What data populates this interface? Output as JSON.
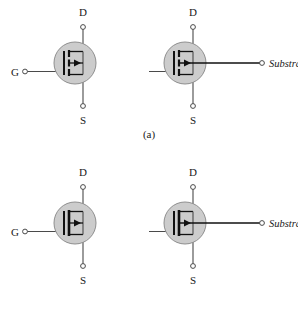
{
  "figure": {
    "background_color": "#ffffff",
    "line_color": "#4a4a4a",
    "device_line_color": "#111111",
    "envelope_fill": "#cccccc",
    "envelope_stroke": "#8f8f8f",
    "terminal_fill": "#ffffff"
  },
  "rows": [
    {
      "caption": "(a)",
      "symbols": [
        {
          "name": "n-channel-enhancement-mosfet-3terminal",
          "drain_label": "D",
          "source_label": "S",
          "gate_label": "G",
          "substrate_label": "",
          "has_substrate_terminal": false,
          "channel_style": "segmented",
          "arrow_direction": "right"
        },
        {
          "name": "n-channel-enhancement-mosfet-4terminal",
          "drain_label": "D",
          "source_label": "S",
          "gate_label": "G",
          "substrate_label": "Substrate",
          "has_substrate_terminal": true,
          "channel_style": "segmented",
          "arrow_direction": "right"
        }
      ]
    },
    {
      "caption": "(b)",
      "symbols": [
        {
          "name": "n-channel-depletion-mosfet-3terminal",
          "drain_label": "D",
          "source_label": "S",
          "gate_label": "G",
          "substrate_label": "",
          "has_substrate_terminal": false,
          "channel_style": "continuous",
          "arrow_direction": "right"
        },
        {
          "name": "n-channel-depletion-mosfet-4terminal",
          "drain_label": "D",
          "source_label": "S",
          "gate_label": "G",
          "substrate_label": "Substrate",
          "has_substrate_terminal": true,
          "channel_style": "continuous",
          "arrow_direction": "right"
        }
      ]
    }
  ]
}
